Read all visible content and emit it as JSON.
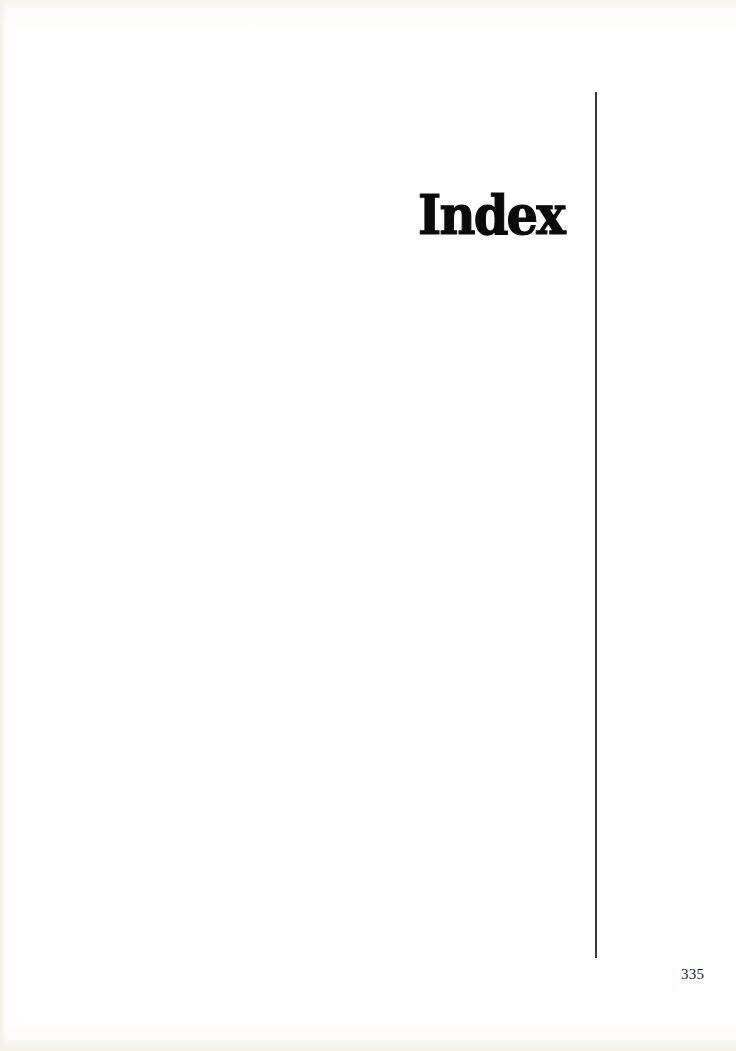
{
  "page": {
    "title": "Index",
    "page_number": "335"
  },
  "colors": {
    "text": "#0b0b0b",
    "rule": "#3a3a3a",
    "paper": "#ffffff",
    "paper_edge": "#f4f0e6"
  }
}
